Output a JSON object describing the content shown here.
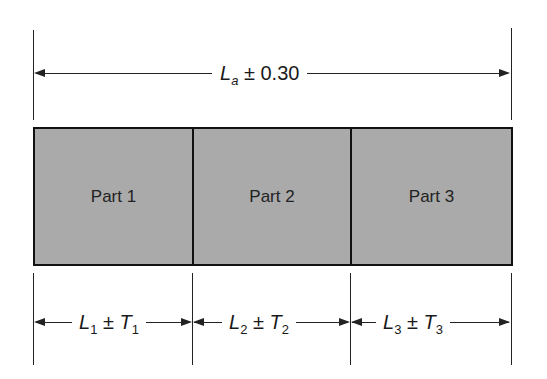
{
  "overall": {
    "symbol": "L",
    "subscript": "a",
    "pm": "±",
    "tolerance": "0.30"
  },
  "parts": [
    {
      "label": "Part 1",
      "length_symbol": "L",
      "length_sub": "1",
      "pm": "±",
      "tol_symbol": "T",
      "tol_sub": "1"
    },
    {
      "label": "Part 2",
      "length_symbol": "L",
      "length_sub": "2",
      "pm": "±",
      "tol_symbol": "T",
      "tol_sub": "2"
    },
    {
      "label": "Part 3",
      "length_symbol": "L",
      "length_sub": "3",
      "pm": "±",
      "tol_symbol": "T",
      "tol_sub": "3"
    }
  ],
  "colors": {
    "part_fill": "#aaaaaa",
    "outline": "#111111"
  }
}
